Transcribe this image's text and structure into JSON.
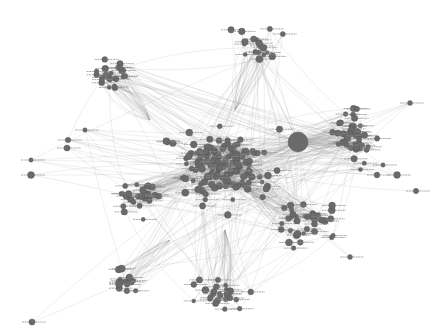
{
  "graph": {
    "title": "Network graph",
    "node_color": "#6a6a6a",
    "node_stroke": "#4a4a4a",
    "edge_color": "#9a9a9a",
    "background": "#ffffff",
    "hub": {
      "x": 298,
      "y": 142,
      "r": 10
    },
    "core": {
      "x": 225,
      "y": 165,
      "rx": 45,
      "ry": 40
    },
    "clusters": [
      {
        "name": "upper-left-fan",
        "cx": 110,
        "cy": 75,
        "rx": 25,
        "ry": 20,
        "n": 22,
        "anchor": [
          150,
          120
        ]
      },
      {
        "name": "top-center",
        "cx": 255,
        "cy": 45,
        "rx": 45,
        "ry": 30,
        "n": 18,
        "anchor": [
          235,
          110
        ]
      },
      {
        "name": "right-fan",
        "cx": 355,
        "cy": 135,
        "rx": 28,
        "ry": 40,
        "n": 45,
        "anchor": [
          298,
          142
        ]
      },
      {
        "name": "left-mid",
        "cx": 135,
        "cy": 195,
        "rx": 30,
        "ry": 30,
        "n": 30,
        "anchor": [
          190,
          175
        ]
      },
      {
        "name": "lower-left",
        "cx": 125,
        "cy": 280,
        "rx": 20,
        "ry": 18,
        "n": 15,
        "anchor": [
          170,
          240
        ]
      },
      {
        "name": "lower-right",
        "cx": 305,
        "cy": 225,
        "rx": 45,
        "ry": 30,
        "n": 35,
        "anchor": [
          250,
          190
        ]
      },
      {
        "name": "bottom",
        "cx": 220,
        "cy": 295,
        "rx": 40,
        "ry": 22,
        "n": 25,
        "anchor": [
          225,
          230
        ]
      },
      {
        "name": "core-ring",
        "cx": 225,
        "cy": 160,
        "rx": 80,
        "ry": 65,
        "n": 70,
        "anchor": [
          225,
          165
        ]
      }
    ],
    "outliers": [
      [
        31,
        160
      ],
      [
        31,
        175
      ],
      [
        67,
        148
      ],
      [
        32,
        322
      ],
      [
        410,
        103
      ],
      [
        397,
        175
      ],
      [
        416,
        191
      ],
      [
        350,
        257
      ],
      [
        377,
        175
      ],
      [
        383,
        165
      ],
      [
        85,
        130
      ],
      [
        68,
        140
      ]
    ],
    "core_node_count": 90,
    "seed": 7
  }
}
